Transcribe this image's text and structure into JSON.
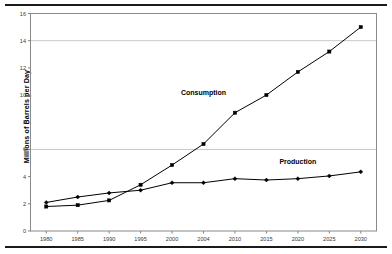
{
  "chart_data": {
    "type": "line",
    "title": "",
    "xlabel": "",
    "ylabel": "Millions of Barrels per Day",
    "categories": [
      "1980",
      "1985",
      "1990",
      "1995",
      "2000",
      "2004",
      "2010",
      "2015",
      "2020",
      "2025",
      "2030"
    ],
    "ylim": [
      0,
      16
    ],
    "yticks": [
      0,
      2,
      4,
      6,
      8,
      10,
      12,
      14,
      16
    ],
    "ytick_labels": [
      "0",
      "2",
      "4",
      "6",
      "8",
      "10",
      "12",
      "14",
      "16"
    ],
    "gridlines": [
      6,
      14
    ],
    "grid": true,
    "legend_position": "inline-annotations",
    "series": [
      {
        "name": "Consumption",
        "marker": "square",
        "color": "#000000",
        "values": [
          1.8,
          1.9,
          2.25,
          3.4,
          4.85,
          6.4,
          8.7,
          10.0,
          11.7,
          13.2,
          15.0
        ]
      },
      {
        "name": "Production",
        "marker": "diamond",
        "color": "#000000",
        "values": [
          2.1,
          2.5,
          2.8,
          3.0,
          3.55,
          3.55,
          3.85,
          3.75,
          3.85,
          4.05,
          4.35
        ]
      }
    ],
    "annotations": [
      {
        "text": "Consumption",
        "x": 2004,
        "y": 10.0
      },
      {
        "text": "Production",
        "x": 2020,
        "y": 4.9
      }
    ]
  },
  "axes": {
    "plot_border_color": "#808080",
    "gridline_color": "#c8c8c8",
    "tick_color": "#808080"
  }
}
